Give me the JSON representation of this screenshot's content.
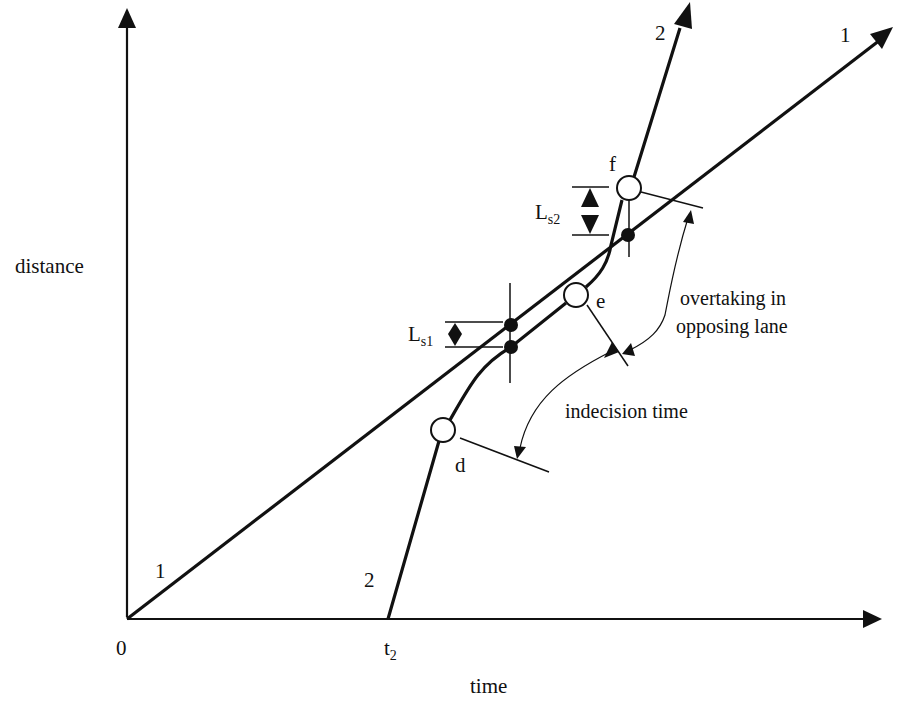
{
  "diagram": {
    "type": "time-distance overtaking diagram",
    "axes": {
      "x_label": "time",
      "y_label": "distance",
      "origin_label": "0",
      "t2_label": "t",
      "t2_subscript": "2"
    },
    "trajectories": [
      {
        "id": "1",
        "label_start": "1",
        "label_end": "1",
        "description": "overtaken vehicle, straight line from origin"
      },
      {
        "id": "2",
        "label_start": "2",
        "label_end": "2",
        "description": "overtaking vehicle, starts at t2"
      }
    ],
    "points": {
      "d": "d",
      "e": "e",
      "f": "f"
    },
    "gaps": {
      "ls1_main": "L",
      "ls1_sub": "s1",
      "ls2_main": "L",
      "ls2_sub": "s2"
    },
    "annotations": {
      "indecision": "indecision time",
      "overtaking_line1": "overtaking in",
      "overtaking_line2": "opposing lane"
    },
    "colors": {
      "ink": "#111111",
      "background": "#ffffff"
    }
  }
}
